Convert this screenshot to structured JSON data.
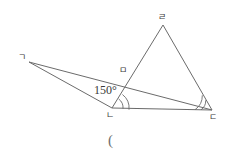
{
  "figure": {
    "type": "geometry-diagram",
    "canvas": {
      "width": 251,
      "height": 162
    },
    "background_color": "#ffffff",
    "stroke_color": "#6b6b6b",
    "text_color": "#3a3a3a"
  },
  "points": [
    {
      "id": "g",
      "label": "ㄱ",
      "x": 29,
      "y": 62,
      "label_x": 18,
      "label_y": 53
    },
    {
      "id": "n",
      "label": "ㄴ",
      "x": 112,
      "y": 108,
      "label_x": 106,
      "label_y": 111
    },
    {
      "id": "d",
      "label": "ㄷ",
      "x": 212,
      "y": 110,
      "label_x": 209,
      "label_y": 113
    },
    {
      "id": "r",
      "label": "ㄹ",
      "x": 163,
      "y": 25,
      "label_x": 158,
      "label_y": 13
    },
    {
      "id": "m",
      "label": "ㅁ",
      "x": 139,
      "y": 72,
      "label_x": 119,
      "label_y": 75
    }
  ],
  "segments": [
    {
      "name": "segment-g-n",
      "from": "g",
      "to": "n"
    },
    {
      "name": "segment-g-d",
      "from": "g",
      "to": "d"
    },
    {
      "name": "segment-n-d",
      "from": "n",
      "to": "d"
    },
    {
      "name": "segment-n-r",
      "from": "n",
      "to": "r"
    },
    {
      "name": "segment-r-d",
      "from": "r",
      "to": "d"
    }
  ],
  "angle_labels": [
    {
      "name": "angle-150",
      "text": "150°",
      "x": 94,
      "y": 84,
      "at_vertex": "n"
    }
  ],
  "angle_arcs": [
    {
      "name": "angle-arc-n-outer",
      "vertex": "n",
      "radius": 17
    },
    {
      "name": "angle-arc-n-inner",
      "vertex": "n",
      "radius": 11
    },
    {
      "name": "angle-arc-d-outer",
      "vertex": "d",
      "radius": 17
    },
    {
      "name": "angle-arc-d-inner",
      "vertex": "d",
      "radius": 11
    }
  ],
  "stray_marks": [
    {
      "name": "stray-paren",
      "text": "(",
      "x": 108,
      "y": 133
    }
  ]
}
